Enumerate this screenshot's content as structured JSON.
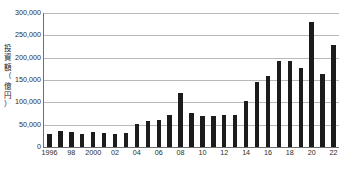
{
  "chart_data": {
    "type": "bar",
    "title": "",
    "xlabel": "",
    "ylabel": "投資額（億円）",
    "ylabel_lines": [
      "投",
      "資",
      "額",
      "（",
      "億",
      "円",
      "）"
    ],
    "ylim": [
      0,
      300000
    ],
    "grid": true,
    "legend": "none",
    "bar_color": "#1c1c1c",
    "gridline_color": "#b9b9b9",
    "axis_color": "#6f6f6f",
    "y_ticks": [
      0,
      50000,
      100000,
      150000,
      200000,
      250000,
      300000
    ],
    "y_tick_labels": [
      "0",
      "50,000",
      "100,000",
      "150,000",
      "200,000",
      "250,000",
      "300,000"
    ],
    "categories": [
      "1996",
      "1997",
      "1998",
      "1999",
      "2000",
      "2001",
      "2002",
      "2003",
      "2004",
      "2005",
      "2006",
      "2007",
      "2008",
      "2009",
      "2010",
      "2011",
      "2012",
      "2013",
      "2014",
      "2015",
      "2016",
      "2017",
      "2018",
      "2019",
      "2020",
      "2021",
      "2022"
    ],
    "x_tick_labels": [
      {
        "category": "1996",
        "label": "1996"
      },
      {
        "category": "1998",
        "label": "98"
      },
      {
        "category": "2000",
        "label": "2000"
      },
      {
        "category": "2002",
        "label": "02"
      },
      {
        "category": "2004",
        "label": "04"
      },
      {
        "category": "2006",
        "label": "06"
      },
      {
        "category": "2008",
        "label": "08"
      },
      {
        "category": "2010",
        "label": "10"
      },
      {
        "category": "2012",
        "label": "12"
      },
      {
        "category": "2014",
        "label": "14"
      },
      {
        "category": "2016",
        "label": "16"
      },
      {
        "category": "2018",
        "label": "18"
      },
      {
        "category": "2020",
        "label": "20"
      },
      {
        "category": "2022",
        "label": "22"
      }
    ],
    "values": [
      30000,
      35000,
      33000,
      30000,
      34000,
      32000,
      30000,
      32000,
      51000,
      58000,
      61000,
      72000,
      120000,
      76000,
      69000,
      69000,
      71000,
      72000,
      103000,
      146000,
      159000,
      192000,
      193000,
      176000,
      281000,
      164000,
      228000
    ]
  }
}
